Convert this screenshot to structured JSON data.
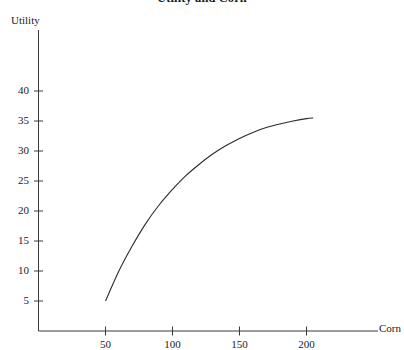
{
  "chart_data": {
    "type": "line",
    "title": "Utility and Corn",
    "xlabel": "Corn",
    "ylabel": "Utility",
    "xlim": [
      0,
      230
    ],
    "ylim": [
      0,
      42
    ],
    "grid": false,
    "legend": "none",
    "xticks": [
      50,
      100,
      150,
      200
    ],
    "xtick_labels": [
      "50",
      "100",
      "150",
      "200"
    ],
    "yticks": [
      5,
      10,
      15,
      20,
      25,
      30,
      35,
      40
    ],
    "ytick_labels": [
      "5",
      "10",
      "15",
      "20",
      "25",
      "30",
      "35",
      "40"
    ],
    "series": [
      {
        "name": "Utility of corn",
        "x": [
          50,
          60,
          70,
          80,
          90,
          100,
          110,
          120,
          130,
          140,
          150,
          160,
          170,
          180,
          190,
          200,
          205
        ],
        "y": [
          5.0,
          10.0,
          14.2,
          17.9,
          21.0,
          23.6,
          25.9,
          27.8,
          29.5,
          30.9,
          32.1,
          33.1,
          33.9,
          34.5,
          35.0,
          35.4,
          35.5
        ]
      }
    ],
    "annotations": [],
    "line_color": "#2a2a2a",
    "axis_color": "#3a3a3a"
  }
}
